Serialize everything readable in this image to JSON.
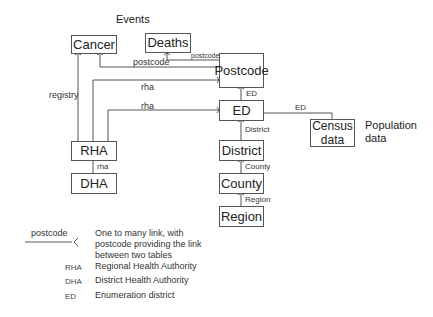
{
  "titles": {
    "events": "Events",
    "population": "Population\ndata"
  },
  "entities": {
    "cancer": "Cancer",
    "deaths": "Deaths",
    "postcode": "Postcode",
    "ed": "ED",
    "census": "Census data",
    "district": "District",
    "county": "County",
    "region": "Region",
    "rha": "RHA",
    "dha": "DHA"
  },
  "links": {
    "deaths_postcode": "postcode",
    "cancer_postcode": "postcode",
    "registry": "registry",
    "rha_postcode": "rha",
    "rha_ed": "rha",
    "postcode_ed": "ED",
    "ed_census": "ED",
    "ed_district": "District",
    "district_county": "County",
    "county_region": "Region",
    "rha_dha": "rha"
  },
  "legend": {
    "link_label": "postcode",
    "link_description": "One to many link, with postcode providing the link between two tables",
    "abbreviations": [
      {
        "abbr": "RHA",
        "meaning": "Regional Health Authority"
      },
      {
        "abbr": "DHA",
        "meaning": "District Health Authority"
      },
      {
        "abbr": "ED",
        "meaning": "Enumeration district"
      }
    ]
  }
}
